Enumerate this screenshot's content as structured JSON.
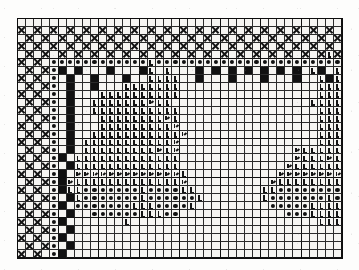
{
  "document": {
    "kind": "needlework-pattern-chart",
    "title": "Filet / Cross-Stitch Pattern Chart",
    "caption": ""
  },
  "chart": {
    "columns": 40,
    "rows": 30,
    "major_every": 5,
    "colors": {
      "ink": "#111111",
      "grid_line": "#2b2b2b",
      "grid_line_major": "#101010",
      "cell_background": "#f6f5f2",
      "paper": "#fdfdfc",
      "frame": "#0d0d0d"
    },
    "legend": [
      {
        "symbol": "x",
        "name": "cross-stitch",
        "glyph": "X"
      },
      {
        "symbol": "b",
        "name": "filled-block",
        "glyph": "■"
      },
      {
        "symbol": "d",
        "name": "dot-stitch",
        "glyph": "●"
      },
      {
        "symbol": "l",
        "name": "corner-stitch",
        "glyph": "L"
      },
      {
        "symbol": "s",
        "name": "corner-stitch-slash",
        "glyph": "L/"
      },
      {
        "symbol": "o",
        "name": "empty-mesh",
        "glyph": ""
      }
    ],
    "rows_data": [
      "oooooooooooooooooooooooooooooooooooooooo",
      "xoxoxoxoxoxoxoxoxoxoxoxoxoxoxoxoxoxoxoxo",
      "oxoxoxoxoxoxoxoxoxoxoxoxoxoxoxoxoxoxoxox",
      "xoxoxoxoxoxoxoxoxoxoxoxoxoxoxoxoxoxoxoxo",
      "oxoxoxoxoxoxoxoxoxoxoxoxoxoxoxoxoxoxoxlx",
      "xoxoddddddddddddlddddddddddddddddddddddd",
      "oxoxdboboooboooblolooobobobobobobobolbolo",
      "xoxodobooboooboollllooboooboooboooboolblL",
      "oxoxdoboobooolllllllooooooooooooooooollll",
      "xoxodobooollllllllllooooooooooooooooollll",
      "oxoxdoboolllllllsllooooooooooooooooollllL",
      "xoxodoboolllllllllllooooooooooooooooollll",
      "oxoxdobooollllllllslooooooooooooooooollll",
      "xoxodobooolllllllllsooooooooooooooooollll",
      "oxoxdoboolllllllllllsoooooooooooooooollll",
      "xoxodobolllllllllllsooooooooooooooooollll",
      "oxoxdobolllllllllslsooooooooooooooslllllL",
      "xoxodbolllllllllllllooooooooooooooslllsll",
      "oxoxdoblllllllllllllooooooooooooosllllLll",
      "xoxodbossssssssssssslooooooooooosssssssss",
      "oxoxdbslllllllllllllsoooooooooosllllllllL",
      "xoxodblldddddddlddddlloooooooollddddddddl",
      "oxoxdobldddddddlddddddloooooooldddddddldl",
      "xoxodbodddddddlllddddlooooooooodddddlllll",
      "oxoxdobooddddddlllddooooooooooooodddlllll",
      "xoxodbooooooolooooooooooooooooooooooollll",
      "oxoxdoboooooooooooooooooooooooooooooooooo",
      "xoxodbooooooooooooooooooooooooooooooooooo",
      "oxoxdoboooooooooooooooooooooooooooooooooo",
      "xoxodbooooooooooooooooooooooooooooooooooo"
    ]
  }
}
